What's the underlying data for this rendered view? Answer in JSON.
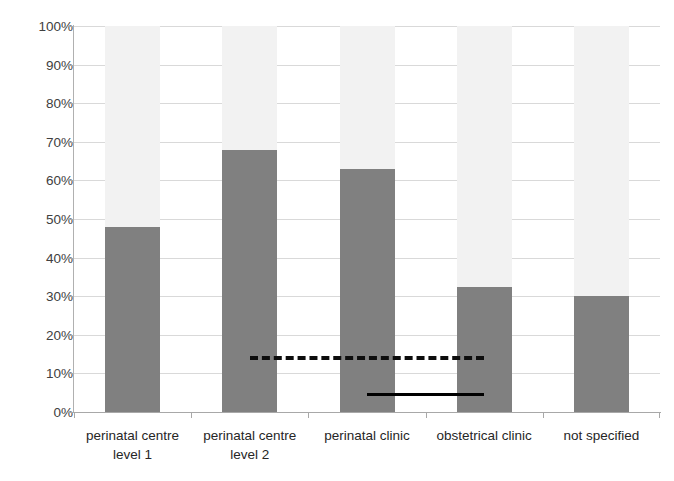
{
  "chart_data": {
    "type": "bar",
    "title": "",
    "subtitle": "",
    "xlabel": "",
    "ylabel": "",
    "categories": [
      "perinatal centre level 1",
      "perinatal centre level 2",
      "perinatal clinic",
      "obstetrical clinic",
      "not specified"
    ],
    "category_lines": [
      [
        "perinatal centre",
        "level 1"
      ],
      [
        "perinatal centre",
        "level 2"
      ],
      [
        "perinatal clinic",
        ""
      ],
      [
        "obstetrical clinic",
        ""
      ],
      [
        "not specified",
        ""
      ]
    ],
    "values": [
      48,
      68,
      63,
      32.5,
      30
    ],
    "value_max": 100,
    "ylim": [
      0,
      100
    ],
    "ytick_values": [
      0,
      10,
      20,
      30,
      40,
      50,
      60,
      70,
      80,
      90,
      100
    ],
    "ytick_labels": [
      "0%",
      "10%",
      "20%",
      "30%",
      "40%",
      "50%",
      "60%",
      "70%",
      "80%",
      "90%",
      "100%"
    ],
    "grid": true,
    "legend": "none",
    "bar_color": "#808080",
    "bar_background_color": "#f2f2f2",
    "gridline_color": "#d9d9d9",
    "axis_color": "#a8a8a8",
    "annotations": [
      {
        "name": "dashed-reference-line",
        "style": "dashed",
        "value": 14.5,
        "color": "#0d0d0d",
        "from_category_index": 1,
        "to_category_index": 3
      },
      {
        "name": "solid-reference-line",
        "style": "solid",
        "value": 5,
        "color": "#000000",
        "from_category_index": 2,
        "to_category_index": 3
      }
    ]
  }
}
